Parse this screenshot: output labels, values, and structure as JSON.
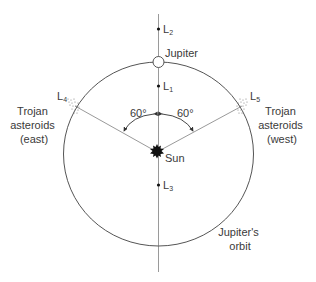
{
  "diagram": {
    "bodies": {
      "sun": {
        "label": "Sun"
      },
      "jupiter": {
        "label": "Jupiter"
      }
    },
    "orbit": {
      "label_line1": "Jupiter's",
      "label_line2": "orbit"
    },
    "lagrange_points": [
      {
        "id": "L1",
        "base": "L",
        "sub": "1"
      },
      {
        "id": "L2",
        "base": "L",
        "sub": "2"
      },
      {
        "id": "L3",
        "base": "L",
        "sub": "3"
      },
      {
        "id": "L4",
        "base": "L",
        "sub": "4"
      },
      {
        "id": "L5",
        "base": "L",
        "sub": "5"
      }
    ],
    "angles": {
      "left": "60°",
      "right": "60°"
    },
    "trojans_east": {
      "line1": "Trojan",
      "line2": "asteroids",
      "line3": "(east)"
    },
    "trojans_west": {
      "line1": "Trojan",
      "line2": "asteroids",
      "line3": "(west)"
    },
    "colors": {
      "line": "#9a9a9a",
      "orbit": "#555555",
      "text": "#3a3a3a",
      "sun": "#111111"
    }
  }
}
